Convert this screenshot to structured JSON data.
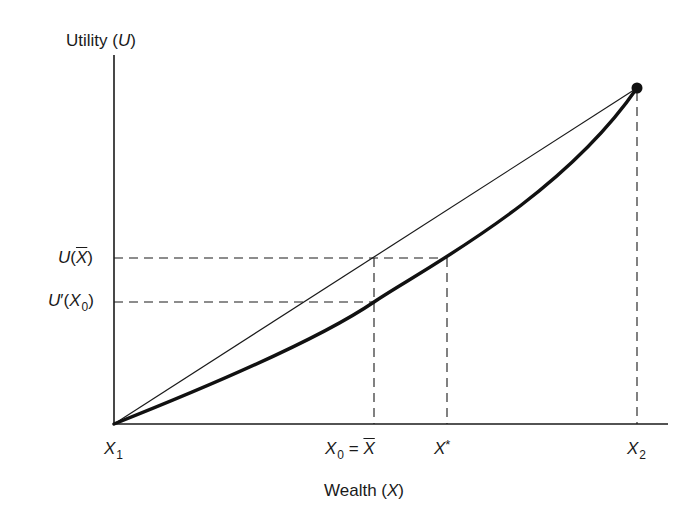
{
  "diagram": {
    "type": "utility-of-wealth",
    "y_axis": {
      "label_text": "Utility",
      "label_symbol": "U"
    },
    "x_axis": {
      "label_text": "Wealth",
      "label_symbol": "X"
    },
    "y_ticks": [
      {
        "id": "u_xbar",
        "prefix": "U",
        "arg": "X",
        "arg_bar": true,
        "arg_sub": "",
        "prime": ""
      },
      {
        "id": "uprime_x0",
        "prefix": "U",
        "arg": "X",
        "arg_bar": false,
        "arg_sub": "0",
        "prime": "′"
      }
    ],
    "x_ticks": [
      {
        "id": "x1",
        "symbol": "X",
        "sub": "1"
      },
      {
        "id": "x0_xbar",
        "symbol": "X",
        "sub": "0",
        "eq": "=",
        "rhs": "X",
        "rhs_bar": true
      },
      {
        "id": "xstar",
        "symbol": "X",
        "sup": "*"
      },
      {
        "id": "x2",
        "symbol": "X",
        "sub": "2"
      }
    ],
    "curves": [
      {
        "id": "chord",
        "description": "straight line from (X1, U(X1)) to (X2, U(X2))",
        "style": "thin"
      },
      {
        "id": "utility-curve",
        "description": "convex utility function (risk-loving)",
        "style": "thick"
      }
    ],
    "endpoint_marker": "filled-dot at (X2, U(X2))",
    "guides": "dashed lines from U(X̄) to chord/curve and from U'(X0) to curve, verticals at X0=X̄, X*, X2"
  },
  "labels": {
    "utility": "Utility",
    "U": "U",
    "wealth": "Wealth",
    "X": "X",
    "paren_open": "(",
    "paren_close": ")",
    "prime": "′",
    "sub0": "0",
    "sub1": "1",
    "sub2": "2",
    "eq": "=",
    "star": "*"
  }
}
